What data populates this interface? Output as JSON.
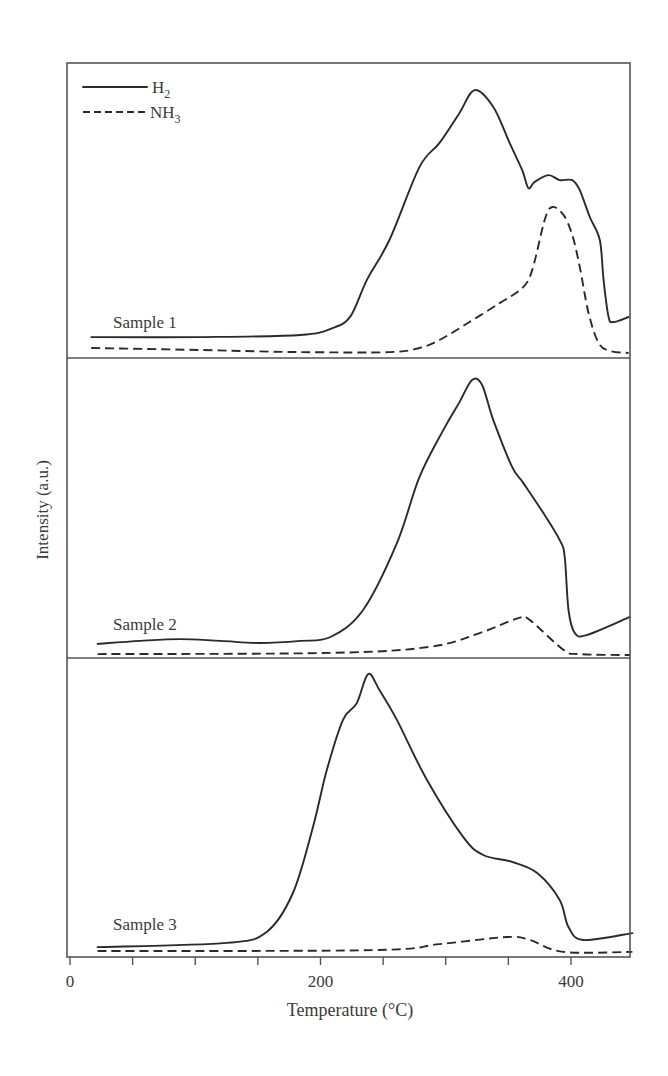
{
  "chart_data": {
    "type": "line",
    "title": "",
    "xlabel": "Temperature (°C)",
    "ylabel": "Intensity (a.u.)",
    "xlim": [
      0,
      450
    ],
    "x_ticks": [
      0,
      50,
      100,
      150,
      200,
      250,
      300,
      350,
      400
    ],
    "x_tick_labels": [
      {
        "value": 0,
        "label": "0"
      },
      {
        "value": 200,
        "label": "200"
      },
      {
        "value": 400,
        "label": "400"
      }
    ],
    "y_ticks": [],
    "grid": false,
    "legend": {
      "position": "upper-left",
      "entries": [
        {
          "name": "H2",
          "label_main": "H",
          "label_sub": "2",
          "style": "solid"
        },
        {
          "name": "NH3",
          "label_main": "NH",
          "label_sub": "3",
          "style": "dashed"
        }
      ]
    },
    "panels": [
      {
        "label": "Sample 1",
        "ylim": [
          0,
          100
        ],
        "series": [
          {
            "name": "H2",
            "style": "solid",
            "x": [
              17,
              104,
              184,
              210,
              224,
              237,
              255,
              279,
              295,
              311,
              323,
              338,
              351,
              361,
              366,
              371,
              382,
              391,
              401,
              407,
              415,
              423,
              426,
              430,
              434,
              446
            ],
            "y": [
              7.1,
              7.1,
              7.8,
              10.2,
              14.2,
              26.4,
              40,
              64.7,
              72.9,
              83.1,
              90.8,
              85.1,
              72.9,
              63.7,
              57.6,
              59.7,
              62,
              60.3,
              60.3,
              56.9,
              47.8,
              40,
              26.4,
              13.9,
              12.2,
              13.9
            ]
          },
          {
            "name": "NH3",
            "style": "dashed",
            "x": [
              17,
              104,
              184,
              255,
              279,
              295,
              319,
              343,
              361,
              369,
              379,
              385,
              394,
              401,
              407,
              414,
              422,
              431,
              446
            ],
            "y": [
              3.4,
              2.7,
              2,
              2,
              3.4,
              6.1,
              12.2,
              18.6,
              23.7,
              29.8,
              46.8,
              51.2,
              48.5,
              41.7,
              30.8,
              15.3,
              5.1,
              2.4,
              1.7
            ]
          }
        ]
      },
      {
        "label": "Sample 2",
        "ylim": [
          0,
          100
        ],
        "series": [
          {
            "name": "H2",
            "style": "solid",
            "x": [
              22,
              56,
              88,
              120,
              152,
              184,
              208,
              234,
              261,
              279,
              299,
              311,
              321,
              329,
              338,
              353,
              362,
              378,
              391,
              395,
              398,
              403,
              413,
              447
            ],
            "y": [
              4.7,
              5.7,
              6.3,
              5.7,
              5,
              5.7,
              7,
              16,
              38.3,
              60.3,
              76.7,
              85.3,
              92.7,
              91,
              79.3,
              63.7,
              58.3,
              48.3,
              39.3,
              33.7,
              16,
              8.3,
              7.7,
              13.7
            ]
          },
          {
            "name": "NH3",
            "style": "dashed",
            "x": [
              22,
              208,
              287,
              327,
              358,
              367,
              394,
              407,
              447
            ],
            "y": [
              1.3,
              1.7,
              3.7,
              8.3,
              13.3,
              12.7,
              2.7,
              1.3,
              1
            ]
          }
        ]
      },
      {
        "label": "Sample 3",
        "ylim": [
          0,
          100
        ],
        "series": [
          {
            "name": "H2",
            "style": "solid",
            "x": [
              22,
              125,
              157,
              178,
              194,
              205,
              218,
              229,
              238,
              247,
              261,
              285,
              314,
              330,
              353,
              373,
              391,
              398,
              410,
              449
            ],
            "y": [
              3.3,
              4.7,
              8.4,
              21.4,
              43.5,
              62.5,
              79.3,
              84.9,
              94.6,
              89.3,
              79.3,
              59.2,
              40.1,
              34.1,
              31.8,
              28.1,
              19.1,
              10,
              5.7,
              8
            ]
          },
          {
            "name": "NH3",
            "style": "dashed",
            "x": [
              22,
              242,
              295,
              349,
              367,
              394,
              449
            ],
            "y": [
              2,
              2.3,
              4.3,
              6.7,
              5.7,
              1.7,
              1.7
            ]
          }
        ]
      }
    ]
  }
}
